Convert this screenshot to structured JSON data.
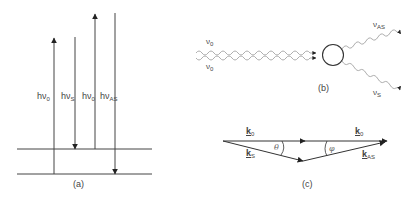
{
  "panel_a": {
    "caption": "(a)",
    "labels": [
      {
        "main": "hν",
        "sub": "0"
      },
      {
        "main": "hν",
        "sub": "S"
      },
      {
        "main": "hν",
        "sub": "0"
      },
      {
        "main": "hν",
        "sub": "AS"
      }
    ]
  },
  "panel_b": {
    "caption": "(b)",
    "labels": {
      "in_top": {
        "main": "ν",
        "sub": "0"
      },
      "in_bottom": {
        "main": "ν",
        "sub": "0"
      },
      "out_top": {
        "main": "ν",
        "sub": "AS"
      },
      "out_bottom": {
        "main": "ν",
        "sub": "S"
      }
    }
  },
  "panel_c": {
    "caption": "(c)",
    "labels": {
      "k0_left": {
        "main": "k",
        "sub": "0"
      },
      "k0_right": {
        "main": "k",
        "sub": "0"
      },
      "kS": {
        "main": "k",
        "sub": "S"
      },
      "kAS": {
        "main": "k",
        "sub": "AS"
      },
      "theta": "θ",
      "phi": "φ"
    }
  },
  "colors": {
    "line": "#333333",
    "wave": "#888888",
    "text": "#444444"
  }
}
